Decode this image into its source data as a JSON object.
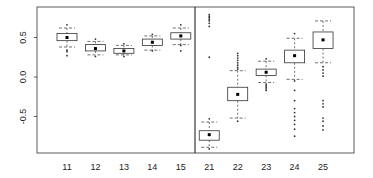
{
  "chart_data": {
    "type": "box",
    "title": "",
    "xlabel": "",
    "ylabel": "",
    "ylim": [
      -0.95,
      0.88
    ],
    "yticks": [
      -0.5,
      0.0,
      0.5
    ],
    "ytick_labels": [
      "-0.5",
      "0.0",
      "0.5"
    ],
    "grid": false,
    "legend": null,
    "panels": [
      {
        "name": "group-1",
        "categories": [
          "11",
          "12",
          "13",
          "14",
          "15"
        ],
        "boxes": [
          {
            "label": "11",
            "median": 0.5,
            "q1": 0.46,
            "q3": 0.55,
            "whisker_low": 0.38,
            "whisker_high": 0.62,
            "outliers": [
              0.66,
              0.34,
              0.32,
              0.27
            ]
          },
          {
            "label": "12",
            "median": 0.36,
            "q1": 0.33,
            "q3": 0.41,
            "whisker_low": 0.28,
            "whisker_high": 0.45,
            "outliers": [
              0.48,
              0.26
            ]
          },
          {
            "label": "13",
            "median": 0.33,
            "q1": 0.3,
            "q3": 0.36,
            "whisker_low": 0.28,
            "whisker_high": 0.4,
            "outliers": [
              0.42,
              0.26
            ]
          },
          {
            "label": "14",
            "median": 0.44,
            "q1": 0.4,
            "q3": 0.48,
            "whisker_low": 0.34,
            "whisker_high": 0.52,
            "outliers": [
              0.54,
              0.33
            ]
          },
          {
            "label": "15",
            "median": 0.52,
            "q1": 0.48,
            "q3": 0.56,
            "whisker_low": 0.41,
            "whisker_high": 0.62,
            "outliers": [
              0.66,
              0.4,
              0.33
            ]
          }
        ]
      },
      {
        "name": "group-2",
        "categories": [
          "21",
          "22",
          "23",
          "24",
          "25"
        ],
        "boxes": [
          {
            "label": "21",
            "median": -0.73,
            "q1": -0.8,
            "q3": -0.68,
            "whisker_low": -0.89,
            "whisker_high": -0.57,
            "outliers": [
              0.79,
              0.77,
              0.75,
              0.73,
              0.71,
              0.68,
              0.64,
              0.25,
              -0.53,
              -0.91
            ]
          },
          {
            "label": "22",
            "median": -0.22,
            "q1": -0.3,
            "q3": -0.13,
            "whisker_low": -0.52,
            "whisker_high": 0.08,
            "outliers": [
              0.3,
              0.27,
              0.24,
              0.21,
              0.18,
              0.15,
              0.12,
              0.1,
              -0.56
            ]
          },
          {
            "label": "23",
            "median": 0.06,
            "q1": 0.02,
            "q3": 0.1,
            "whisker_low": -0.07,
            "whisker_high": 0.2,
            "outliers": [
              0.23,
              -0.09,
              -0.11,
              -0.13,
              -0.15,
              -0.17
            ]
          },
          {
            "label": "24",
            "median": 0.27,
            "q1": 0.18,
            "q3": 0.34,
            "whisker_low": -0.03,
            "whisker_high": 0.49,
            "outliers": [
              0.55,
              -0.05,
              -0.17,
              -0.3,
              -0.4,
              -0.45,
              -0.5,
              -0.55,
              -0.6,
              -0.66,
              -0.75
            ]
          },
          {
            "label": "25",
            "median": 0.47,
            "q1": 0.36,
            "q3": 0.57,
            "whisker_low": 0.18,
            "whisker_high": 0.71,
            "outliers": [
              0.13,
              0.09,
              0.05,
              0.01,
              -0.3,
              -0.34,
              -0.38,
              -0.52,
              -0.56,
              -0.62,
              -0.67
            ]
          }
        ]
      }
    ]
  }
}
